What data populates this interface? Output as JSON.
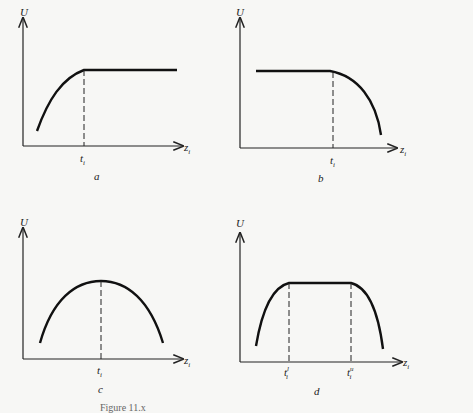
{
  "figure": {
    "caption": "Figure 11.x",
    "panels": [
      {
        "id": "a",
        "ylabel": "U",
        "xlabel": "z",
        "xlabel_sub": "i",
        "ticks": [
          {
            "base": "t",
            "sub": "i",
            "sup": ""
          }
        ],
        "shape": "increasing then constant"
      },
      {
        "id": "b",
        "ylabel": "U",
        "xlabel": "z",
        "xlabel_sub": "i",
        "ticks": [
          {
            "base": "t",
            "sub": "i",
            "sup": ""
          }
        ],
        "shape": "constant then decreasing"
      },
      {
        "id": "c",
        "ylabel": "U",
        "xlabel": "z",
        "xlabel_sub": "i",
        "ticks": [
          {
            "base": "t",
            "sub": "i",
            "sup": ""
          }
        ],
        "shape": "single peak at t_i"
      },
      {
        "id": "d",
        "ylabel": "U",
        "xlabel": "z",
        "xlabel_sub": "i",
        "ticks": [
          {
            "base": "t",
            "sub": "i",
            "sup": "l"
          },
          {
            "base": "t",
            "sub": "i",
            "sup": "u"
          }
        ],
        "shape": "increasing, plateau between t_i^l and t_i^u, decreasing"
      }
    ]
  }
}
